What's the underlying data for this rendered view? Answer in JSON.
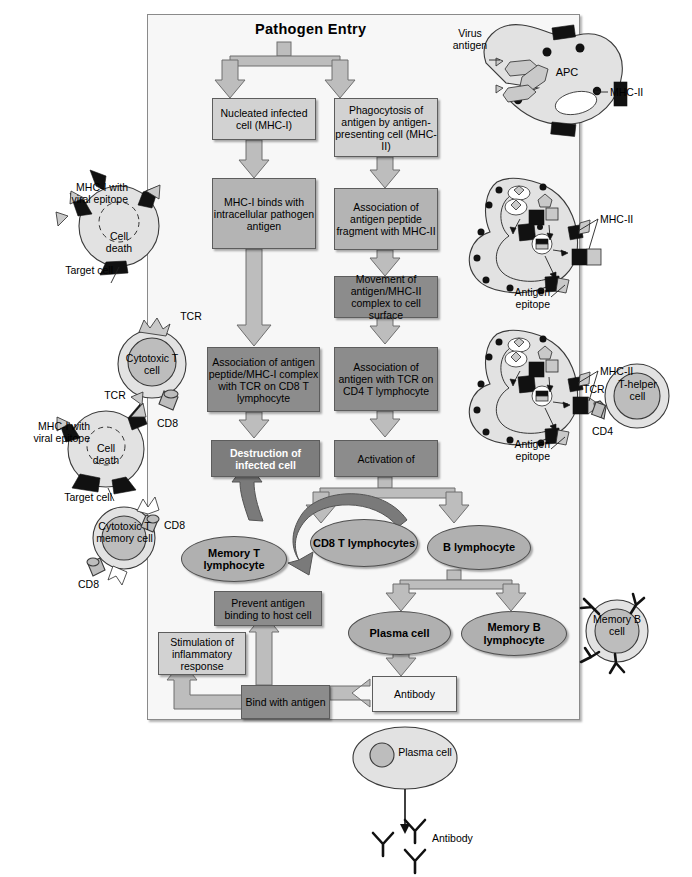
{
  "diagram": {
    "title": "Pathogen Entry",
    "type": "immune-response-flowchart"
  },
  "boxes": {
    "nucleated_infected": "Nucleated infected cell (MHC-I)",
    "phagocytosis": "Phagocytosis of antigen by antigen-presenting cell (MHC-II)",
    "mhc1_binds": "MHC-I binds with intracellular pathogen antigen",
    "assoc_peptide_mhc2": "Association of antigen peptide fragment with MHC-II",
    "movement_mhc2": "Movement of antigen/MHC-II complex to cell surface",
    "assoc_tcr_cd8": "Association of antigen peptide/MHC-I complex with TCR on CD8 T lymphocyte",
    "assoc_tcr_cd4": "Association of antigen with TCR on CD4 T lymphocyte",
    "destruction": "Destruction of infected cell",
    "activation": "Activation of",
    "prevent_binding": "Prevent antigen binding to host cell",
    "stimulation": "Stimulation of inflammatory response",
    "bind_with_antigen": "Bind with antigen",
    "antibody": "Antibody"
  },
  "ellipses": {
    "cd8_t_lymphocytes": "CD8 T lymphocytes",
    "memory_t_lymphocyte": "Memory T lymphocyte",
    "b_lymphocyte": "B lymphocyte",
    "plasma_cell": "Plasma cell",
    "memory_b_lymphocyte": "Memory B lymphocyte"
  },
  "cells": {
    "apc": "APC",
    "cytotoxic_t_cell": "Cytotoxic T cell",
    "cytotoxic_t_memory_cell": "Cytotoxic T memory cell",
    "t_helper_cell": "T-helper cell",
    "memory_b_cell": "Memory B cell",
    "plasma_cell_bottom": "Plasma cell"
  },
  "labels": {
    "virus_antigen": "Virus antigen",
    "mhc2_top": "MHC-II",
    "mhc2_mid": "MHC-II",
    "mhc2_low": "MHC-II",
    "antigen_epitope_mid": "Antigen epitope",
    "antigen_epitope_low": "Antigen epitope",
    "tcr_right": "TCR",
    "cd4": "CD4",
    "mhc1_viral_epitope_top": "MHC-I with viral epitope",
    "mhc1_viral_epitope_bottom": "MHC-I with viral epitope",
    "target_cell_top": "Target cell",
    "target_cell_bottom": "Target cell",
    "cell_death_top": "Cell death",
    "cell_death_bottom": "Cell death",
    "tcr_top_left": "TCR",
    "tcr_left": "TCR",
    "cd8_upper": "CD8",
    "cd8_mem_right": "CD8",
    "cd8_mem_left": "CD8",
    "antibody_bottom": "Antibody"
  },
  "colors": {
    "frame_bg": "#f7f7f7",
    "box_light": "#d2d2d2",
    "box_mid": "#b4b4b4",
    "box_dark": "#8c8c8c",
    "box_darker": "#7d7d7d",
    "ellipse": "#b0b0b0",
    "arrow_fill": "#bdbdbd",
    "arrow_dark": "#7a7a7a",
    "outline": "#5d5d5d"
  }
}
